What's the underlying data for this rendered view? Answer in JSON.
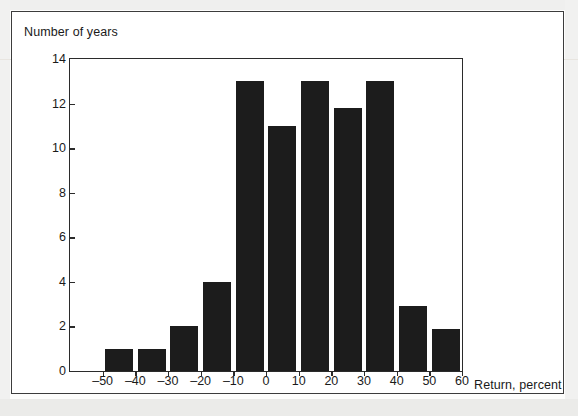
{
  "figure": {
    "y_axis_title": "Number of years",
    "x_axis_title": "Return, percent"
  },
  "chart_data": {
    "type": "bar",
    "title": "",
    "subtitle": "",
    "xlabel": "Return, percent",
    "ylabel": "Number of years",
    "xlim": [
      -60,
      60
    ],
    "ylim": [
      0,
      14
    ],
    "grid": false,
    "legend": null,
    "bin_width": 10,
    "x_ticks": [
      "–50",
      "–40",
      "–30",
      "–20",
      "–10",
      "0",
      "10",
      "20",
      "30",
      "40",
      "50",
      "60"
    ],
    "x_tick_values": [
      -50,
      -40,
      -30,
      -20,
      -10,
      0,
      10,
      20,
      30,
      40,
      50,
      60
    ],
    "y_ticks": [
      "0",
      "2",
      "4",
      "6",
      "8",
      "10",
      "12",
      "14"
    ],
    "y_tick_values": [
      0,
      2,
      4,
      6,
      8,
      10,
      12,
      14
    ],
    "bins": [
      {
        "label": "–50 to –40",
        "x0": -50,
        "x1": -40,
        "value": 1
      },
      {
        "label": "–40 to –30",
        "x0": -40,
        "x1": -30,
        "value": 1
      },
      {
        "label": "–30 to –20",
        "x0": -30,
        "x1": -20,
        "value": 2
      },
      {
        "label": "–20 to –10",
        "x0": -20,
        "x1": -10,
        "value": 4
      },
      {
        "label": "–10 to 0",
        "x0": -10,
        "x1": 0,
        "value": 13
      },
      {
        "label": "0 to 10",
        "x0": 0,
        "x1": 10,
        "value": 11
      },
      {
        "label": "10 to 20",
        "x0": 10,
        "x1": 20,
        "value": 13
      },
      {
        "label": "20 to 30",
        "x0": 20,
        "x1": 30,
        "value": 11.8
      },
      {
        "label": "30 to 40",
        "x0": 30,
        "x1": 40,
        "value": 13
      },
      {
        "label": "40 to 50",
        "x0": 40,
        "x1": 50,
        "value": 2.9
      },
      {
        "label": "50 to 60",
        "x0": 50,
        "x1": 60,
        "value": 1.9
      }
    ],
    "categories": [
      "–50 to –40",
      "–40 to –30",
      "–30 to –20",
      "–20 to –10",
      "–10 to 0",
      "0 to 10",
      "10 to 20",
      "20 to 30",
      "30 to 40",
      "40 to 50",
      "50 to 60"
    ],
    "values": [
      1,
      1,
      2,
      4,
      13,
      11,
      13,
      11.8,
      13,
      2.9,
      1.9
    ],
    "colors": {
      "bar": "#1c1c1c",
      "axis": "#2b2b2b",
      "text": "#1a1a1a",
      "background": "#ffffff"
    }
  }
}
